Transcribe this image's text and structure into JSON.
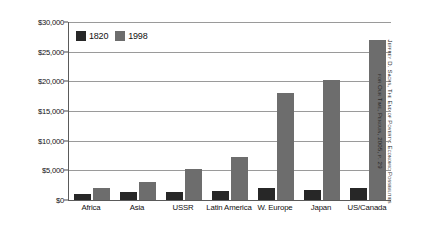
{
  "chart_data": {
    "type": "bar",
    "title": "",
    "xlabel": "",
    "ylabel": "Per Capita in 1990 US Dollars",
    "categories": [
      "Africa",
      "Asia",
      "USSR",
      "Latin America",
      "W. Europe",
      "Japan",
      "US/Canada"
    ],
    "series": [
      {
        "name": "1820",
        "values": [
          1000,
          1400,
          1400,
          1500,
          2100,
          1700,
          2000
        ]
      },
      {
        "name": "1998",
        "values": [
          2000,
          3000,
          5200,
          7200,
          18000,
          20300,
          27000
        ]
      }
    ],
    "ylim": [
      0,
      30000
    ],
    "ytick_values": [
      0,
      5000,
      10000,
      15000,
      20000,
      25000,
      30000
    ],
    "ytick_labels": [
      "$0",
      "$5,000",
      "$10,000",
      "$15,000",
      "$20,000",
      "$25,000",
      "$30,000"
    ],
    "grid": true,
    "legend_position": "upper-left-inside",
    "colors": {
      "series_1820": "#272727",
      "series_1998": "#6d6d6d",
      "gridline": "#9a9a9a",
      "axis": "#5a5a5a",
      "background": "#ffffff",
      "text": "#111111"
    }
  },
  "legend": {
    "entries": [
      {
        "label": "1820",
        "color": "#272727"
      },
      {
        "label": "1998",
        "color": "#6d6d6d"
      }
    ]
  },
  "source_caption": {
    "line1": "Jeffrey D. Sachs, The End of Poverty: Economic Possibilities",
    "line2": "for Our Time, Penguin, 2005, p. 29"
  }
}
